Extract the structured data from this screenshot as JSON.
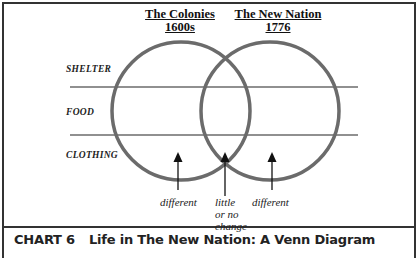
{
  "diagram": {
    "type": "venn",
    "sets": [
      {
        "title": "The Colonies",
        "subtitle": "1600s"
      },
      {
        "title": "The New Nation",
        "subtitle": "1776"
      }
    ],
    "rows": [
      "SHELTER",
      "FOOD",
      "CLOTHING"
    ],
    "annotations": {
      "left": "different",
      "center_line1": "little",
      "center_line2": "or no",
      "center_line3": "change",
      "right": "different"
    },
    "colors": {
      "circle": "#6b6b6b",
      "line": "#222222",
      "frame": "#333333"
    }
  },
  "caption": {
    "number": "CHART 6",
    "title": "Life in The New Nation: A Venn Diagram"
  }
}
